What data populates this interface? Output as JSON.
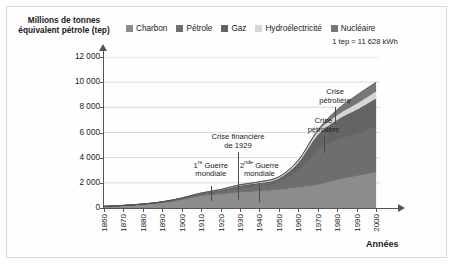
{
  "figure": {
    "y_axis_title": "Millions de tonnes équivalent pétrole",
    "y_axis_unit": "(tep)",
    "x_axis_title": "Années",
    "note": "1 tep = 11 628 kWh"
  },
  "legend": {
    "position": "top",
    "items": [
      {
        "label": "Charbon",
        "color": "#8c8c8c",
        "icon": "legend-swatch-icon"
      },
      {
        "label": "Pétrole",
        "color": "#6e6e6e",
        "icon": "legend-swatch-icon"
      },
      {
        "label": "Gaz",
        "color": "#646464",
        "icon": "legend-swatch-icon"
      },
      {
        "label": "Hydroélectricité",
        "color": "#d6d6d6",
        "icon": "legend-swatch-icon"
      },
      {
        "label": "Nucléaire",
        "color": "#767676",
        "icon": "legend-swatch-icon"
      }
    ]
  },
  "annotations": [
    {
      "name": "annotation-guerre-1",
      "line1": "1",
      "sup": "re",
      "line1b": " Guerre",
      "line2": "mondiale",
      "year": 1915
    },
    {
      "name": "annotation-crise-1929",
      "line1": "Crise financière",
      "line2": "de 1929",
      "year": 1929
    },
    {
      "name": "annotation-guerre-2",
      "line1": "2",
      "sup": "nde",
      "line1b": " Guerre",
      "line2": "mondiale",
      "year": 1940
    },
    {
      "name": "annotation-crise-petroliere-1",
      "line1": "Crise",
      "line2": "pétrolière",
      "year": 1973
    },
    {
      "name": "annotation-crise-petroliere-2",
      "line1": "Crise",
      "line2": "pétrolière",
      "year": 1979
    }
  ],
  "chart_data": {
    "type": "area",
    "stacked": true,
    "title": "Millions de tonnes équivalent pétrole (tep)",
    "xlabel": "Années",
    "ylabel": "Millions de tonnes équivalent pétrole (tep)",
    "xlim": [
      1860,
      2002
    ],
    "ylim": [
      0,
      12000
    ],
    "ytick_labels": [
      "0",
      "2 000",
      "4 000",
      "6 000",
      "8 000",
      "10 000",
      "12 000"
    ],
    "yticks": [
      0,
      2000,
      4000,
      6000,
      8000,
      10000,
      12000
    ],
    "xticks": [
      1860,
      1870,
      1880,
      1890,
      1900,
      1910,
      1920,
      1930,
      1940,
      1950,
      1960,
      1970,
      1980,
      1990,
      2000
    ],
    "xtick_labels": [
      "1860",
      "1870",
      "1880",
      "1890",
      "1900",
      "1910",
      "1920",
      "1930",
      "1940",
      "1950",
      "1960",
      "1970",
      "1980",
      "1990",
      "2000"
    ],
    "grid": "horizontal",
    "legend_position": "top",
    "x": [
      1860,
      1870,
      1880,
      1890,
      1900,
      1910,
      1920,
      1930,
      1940,
      1950,
      1960,
      1970,
      1980,
      1990,
      2000
    ],
    "series": [
      {
        "name": "Charbon",
        "color": "#8c8c8c",
        "values": [
          130,
          200,
          300,
          450,
          700,
          1000,
          1150,
          1300,
          1400,
          1500,
          1700,
          1900,
          2300,
          2600,
          2900
        ]
      },
      {
        "name": "Pétrole",
        "color": "#6e6e6e",
        "values": [
          0,
          5,
          15,
          30,
          60,
          120,
          200,
          350,
          420,
          600,
          1300,
          2700,
          3200,
          3300,
          3600
        ]
      },
      {
        "name": "Gaz",
        "color": "#646464",
        "values": [
          0,
          0,
          3,
          8,
          20,
          40,
          70,
          120,
          160,
          250,
          600,
          1200,
          1500,
          1900,
          2200
        ]
      },
      {
        "name": "Hydroélectricité",
        "color": "#d6d6d6",
        "values": [
          0,
          0,
          0,
          5,
          15,
          30,
          50,
          80,
          100,
          130,
          200,
          320,
          420,
          520,
          600
        ]
      },
      {
        "name": "Nucléaire",
        "color": "#767676",
        "values": [
          0,
          0,
          0,
          0,
          0,
          0,
          0,
          0,
          0,
          0,
          10,
          80,
          400,
          650,
          700
        ]
      }
    ],
    "annotations": [
      {
        "text": "1re Guerre mondiale",
        "year": 1915
      },
      {
        "text": "Crise financière de 1929",
        "year": 1929
      },
      {
        "text": "2nde Guerre mondiale",
        "year": 1940
      },
      {
        "text": "Crise pétrolière",
        "year": 1973
      },
      {
        "text": "Crise pétrolière",
        "year": 1979
      }
    ]
  }
}
